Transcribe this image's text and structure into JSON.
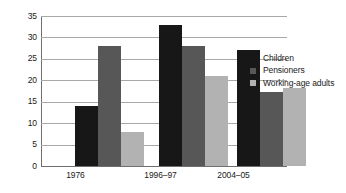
{
  "chart_data": {
    "type": "bar",
    "title": "",
    "subtitle": "",
    "xlabel": "",
    "ylabel": "",
    "categories": [
      "1976",
      "1996–97",
      "2004–05"
    ],
    "series": [
      {
        "name": "Children",
        "color": "#171717",
        "values": [
          14,
          33,
          27
        ]
      },
      {
        "name": "Pensioners",
        "color": "#575757",
        "values": [
          28,
          28,
          17.3
        ]
      },
      {
        "name": "Working-age adults",
        "color": "#b2b2b2",
        "values": [
          8,
          21,
          18.3
        ]
      }
    ],
    "ylim": [
      0,
      35
    ],
    "ytick_step": 5,
    "yticks": [
      "0",
      "5",
      "10",
      "15",
      "20",
      "25",
      "30",
      "35"
    ],
    "grid": true,
    "grid_axis": "y",
    "legend_position": "right",
    "annotations": []
  },
  "legend": {
    "entries": [
      {
        "label": "Children",
        "swatch": "children-swatch"
      },
      {
        "label": "Pensioners",
        "swatch": "pensioners-swatch"
      },
      {
        "label": "Working-age adults",
        "swatch": "working-age-adults-swatch"
      }
    ]
  },
  "axes": {
    "y_tick_labels": [
      "35",
      "30",
      "25",
      "20",
      "15",
      "10",
      "5",
      "0"
    ],
    "x_tick_labels": [
      "1976",
      "1996–97",
      "2004–05"
    ]
  },
  "colors": {
    "children": "#171717",
    "pensioners": "#575757",
    "working_age_adults": "#b2b2b2",
    "gridline": "#a8a8a8",
    "axis": "#6f6f6f",
    "background": "#ffffff",
    "text": "#1a1a1a"
  }
}
